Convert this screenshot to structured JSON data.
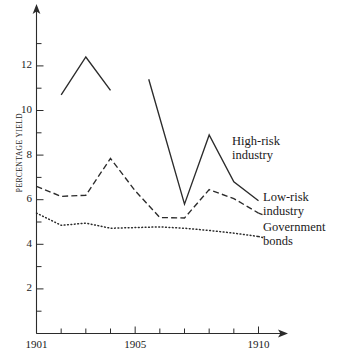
{
  "chart_data": {
    "type": "line",
    "title": "",
    "xlabel": "",
    "ylabel": "PERCENTAGE YIELD",
    "xlim": [
      1901,
      1910.6
    ],
    "ylim": [
      0,
      13.4
    ],
    "grid": false,
    "legend_position": "inline-right-annotations",
    "x_ticks": [
      1901,
      1902,
      1903,
      1904,
      1905,
      1906,
      1907,
      1908,
      1909,
      1910
    ],
    "x_tick_labels": [
      "1901",
      "",
      "",
      "",
      "1905",
      "",
      "",
      "",
      "",
      "1910"
    ],
    "y_ticks": [
      1,
      2,
      3,
      4,
      5,
      6,
      7,
      8,
      9,
      10,
      11,
      12,
      13
    ],
    "y_tick_labels": [
      "",
      "2",
      "",
      "4",
      "",
      "6",
      "",
      "8",
      "",
      "10",
      "",
      "12",
      ""
    ],
    "series": [
      {
        "name": "High-risk industry",
        "style": "solid",
        "segments": [
          {
            "x": [
              1902.0,
              1903.0,
              1904.0
            ],
            "values": [
              10.7,
              12.4,
              10.9
            ]
          },
          {
            "x": [
              1905.55,
              1907.0,
              1908.0,
              1909.0,
              1910.0
            ],
            "values": [
              11.4,
              5.8,
              8.9,
              6.8,
              5.95
            ]
          }
        ]
      },
      {
        "name": "Low-risk industry",
        "style": "dashed",
        "x": [
          1901.0,
          1902.0,
          1903.0,
          1904.0,
          1905.0,
          1906.0,
          1907.0,
          1908.0,
          1909.0,
          1910.0
        ],
        "values": [
          6.6,
          6.15,
          6.2,
          7.85,
          6.4,
          5.2,
          5.18,
          6.45,
          6.05,
          5.4
        ]
      },
      {
        "name": "Government bonds",
        "style": "dotted",
        "x": [
          1901.0,
          1902.0,
          1903.0,
          1904.0,
          1905.0,
          1906.0,
          1907.0,
          1908.0,
          1909.0,
          1910.0
        ],
        "values": [
          5.4,
          4.85,
          4.95,
          4.72,
          4.75,
          4.78,
          4.72,
          4.62,
          4.5,
          4.35
        ]
      }
    ],
    "annotations": [
      {
        "name": "high-risk-industry",
        "line1": "High-risk",
        "line2": "industry"
      },
      {
        "name": "low-risk-industry",
        "line1": "Low-risk",
        "line2": "industry"
      },
      {
        "name": "government-bonds",
        "line1": "Government",
        "line2": "bonds"
      }
    ]
  },
  "colors": {
    "ink": "#2b2b2b",
    "background": "#ffffff"
  }
}
